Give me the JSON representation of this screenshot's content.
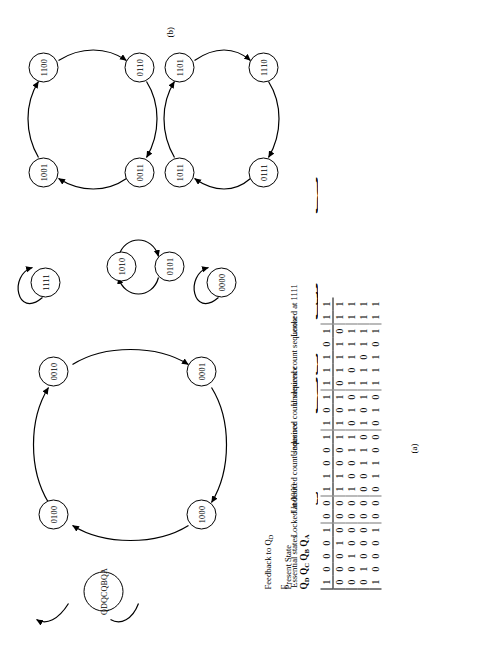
{
  "figure": {
    "part_a_label": "(a)",
    "part_b_label": "(b)"
  },
  "table": {
    "header_present_state": "Present State",
    "header_q_bits": [
      "Q",
      "D",
      "Q",
      "C",
      "Q",
      "B",
      "Q",
      "A"
    ],
    "header_q_plain": "QD QC QB QA",
    "header_feedback": "Feedback to Q",
    "header_feedback_sub": "D",
    "header_f": "F",
    "row_labels": [
      "QD",
      "QC",
      "QB",
      "QA"
    ],
    "blocks": [
      {
        "annotation": "Essential states",
        "states": [
          "0001",
          "0010",
          "0100",
          "1000",
          "0001"
        ],
        "f": [
          "1",
          "0",
          "0",
          "0",
          "1"
        ]
      },
      {
        "annotation": "Locked at 0000",
        "states": [
          "0000",
          "0000"
        ],
        "f": [
          "0",
          "0"
        ]
      },
      {
        "annotation": "Undesired count sequence",
        "states": [
          "1100",
          "1001",
          "0011",
          "0110",
          "1100"
        ],
        "f": [
          "1",
          "1",
          "0",
          "0",
          "1"
        ]
      },
      {
        "annotation": "Undesired count sequence",
        "states": [
          "1010",
          "0101",
          "1010"
        ],
        "f": [
          "1",
          "0",
          "1"
        ]
      },
      {
        "annotation": "Undesired count sequence",
        "states": [
          "0111",
          "1011",
          "1101",
          "1110",
          "0111"
        ],
        "f": [
          "1",
          "1",
          "1",
          "0",
          "1"
        ]
      },
      {
        "annotation": "Locked at 1111",
        "states": [
          "1111",
          "1111"
        ],
        "f": [
          "1",
          "1"
        ]
      }
    ]
  },
  "diagram": {
    "legend_node": "QDQCQBQA",
    "main_ring": [
      "0100",
      "0010",
      "0001",
      "1000"
    ],
    "self_loop_nodes": [
      "1111",
      "0000"
    ],
    "two_cycle": [
      "1010",
      "0101"
    ],
    "ring_upper_right": [
      "1001",
      "1100",
      "0110",
      "0011"
    ],
    "ring_lower_right": [
      "1011",
      "1101",
      "1110",
      "0111"
    ]
  }
}
